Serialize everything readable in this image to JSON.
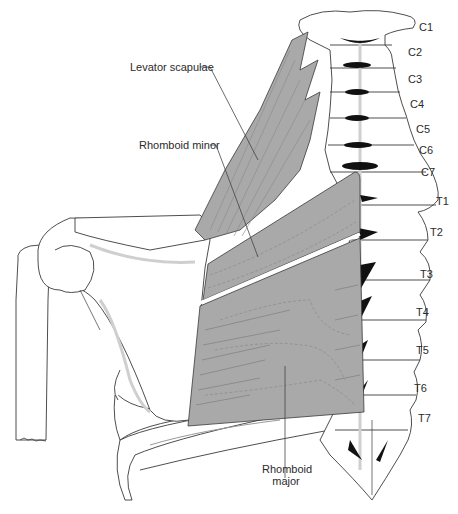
{
  "figure": {
    "colors": {
      "muscle_fill": "#a9a9a9",
      "bone_fill": "#ffffff",
      "bone_shadow": "#cfcfcf",
      "outline": "#3a3a3a",
      "disc_dark": "#111111",
      "leader_line": "#444444"
    }
  },
  "labels": {
    "levator_scapulae": "Levator scapulae",
    "rhomboid_minor": "Rhomboid minor",
    "rhomboid_major_line1": "Rhomboid",
    "rhomboid_major_line2": "major"
  },
  "vertebrae": [
    {
      "id": "C1",
      "label": "C1"
    },
    {
      "id": "C2",
      "label": "C2"
    },
    {
      "id": "C3",
      "label": "C3"
    },
    {
      "id": "C4",
      "label": "C4"
    },
    {
      "id": "C5",
      "label": "C5"
    },
    {
      "id": "C6",
      "label": "C6"
    },
    {
      "id": "C7",
      "label": "C7"
    },
    {
      "id": "T1",
      "label": "T1"
    },
    {
      "id": "T2",
      "label": "T2"
    },
    {
      "id": "T3",
      "label": "T3"
    },
    {
      "id": "T4",
      "label": "T4"
    },
    {
      "id": "T5",
      "label": "T5"
    },
    {
      "id": "T6",
      "label": "T6"
    },
    {
      "id": "T7",
      "label": "T7"
    }
  ]
}
